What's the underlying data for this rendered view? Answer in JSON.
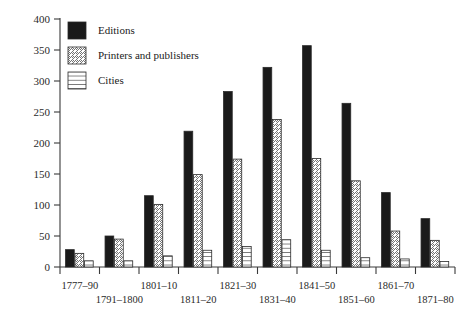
{
  "chart_data": {
    "type": "bar",
    "title": "",
    "subtitle": "",
    "xlabel": "",
    "ylabel": "",
    "ylim": [
      0,
      400
    ],
    "ytick_values": [
      0,
      50,
      100,
      150,
      200,
      250,
      300,
      350,
      400
    ],
    "ytick_labels": [
      "0",
      "50",
      "100",
      "150",
      "200",
      "250",
      "300",
      "350",
      "400"
    ],
    "grid": false,
    "legend_position": "top-left",
    "categories": [
      "1777–90",
      "1791–1800",
      "1801–10",
      "1811–20",
      "1821–30",
      "1831–40",
      "1841–50",
      "1851–60",
      "1861–70",
      "1871–80"
    ],
    "series": [
      {
        "name": "Editions",
        "fill": "solid-black",
        "color": "#1a1a1a",
        "values": [
          28,
          50,
          115,
          219,
          283,
          322,
          357,
          264,
          120,
          78
        ]
      },
      {
        "name": "Printers and publishers",
        "fill": "diagonal-hatch",
        "color": "#ffffff",
        "values": [
          22,
          45,
          101,
          149,
          174,
          238,
          175,
          139,
          58,
          43
        ]
      },
      {
        "name": "Cities",
        "fill": "horizontal-hatch",
        "color": "#ffffff",
        "values": [
          10,
          10,
          18,
          27,
          33,
          44,
          27,
          15,
          13,
          9
        ]
      }
    ]
  },
  "legend": {
    "items": [
      {
        "label": "Editions",
        "swatch": "solid-black"
      },
      {
        "label": "Printers and publishers",
        "swatch": "diagonal-hatch"
      },
      {
        "label": "Cities",
        "swatch": "horizontal-hatch"
      }
    ]
  },
  "axes": {
    "y_axis_name": "y-axis",
    "x_axis_name": "x-axis"
  },
  "colors": {
    "axis": "#3a3a3a",
    "text": "#1a1a1a",
    "bar_edge": "#2a2a2a",
    "editions": "#1a1a1a",
    "background": "#ffffff"
  }
}
